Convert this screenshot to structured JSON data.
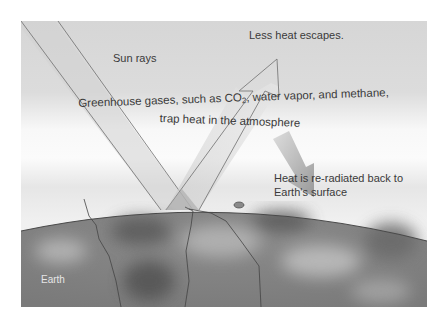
{
  "diagram": {
    "labels": {
      "sun_rays": "Sun rays",
      "less_heat": "Less heat escapes.",
      "greenhouse_line1_pre": "Greenhouse gases, such as CO",
      "greenhouse_line1_sub": "2",
      "greenhouse_line1_post": ", water vapor, and methane,",
      "greenhouse_line2": "trap heat in the atmosphere",
      "reradiated_line1": "Heat is re-radiated back to",
      "reradiated_line2": "Earth's surface",
      "earth": "Earth"
    },
    "colors": {
      "sky_top": "#d9d9d9",
      "atmosphere_band": "#f7f7f7",
      "ray_fill": "#cfcfcf",
      "ray_stroke": "#6e6e6e",
      "earth_dark": "#6a6a6a",
      "earth_light": "#a8a8a8",
      "text": "#3a3a3a",
      "earth_label": "#e6e6e6"
    }
  }
}
